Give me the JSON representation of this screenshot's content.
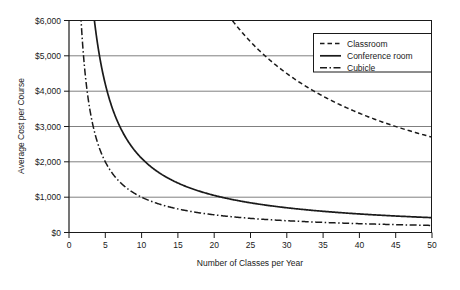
{
  "chart_data": {
    "type": "line",
    "title": "",
    "xlabel": "Number of Classes per Year",
    "ylabel": "Average Cost per Course",
    "xlim": [
      0,
      50
    ],
    "ylim": [
      0,
      6000
    ],
    "xticks": [
      0,
      5,
      10,
      15,
      20,
      25,
      30,
      35,
      40,
      45,
      50
    ],
    "xtick_labels": [
      "0",
      "5",
      "10",
      "15",
      "20",
      "25",
      "30",
      "35",
      "40",
      "45",
      "50"
    ],
    "yticks": [
      0,
      1000,
      2000,
      3000,
      4000,
      5000,
      6000
    ],
    "ytick_labels": [
      "$0",
      "$1,000",
      "$2,000",
      "$3,000",
      "$4,000",
      "$5,000",
      "$6,000"
    ],
    "grid": "horizontal",
    "legend_position": "top-right",
    "series": [
      {
        "name": "Classroom",
        "style": "dashed",
        "color": "#1a1a1a",
        "model": "fixed_cost_over_classes",
        "fixed_cost": 135000,
        "x": [
          22,
          24,
          26,
          28,
          30,
          32,
          34,
          36,
          38,
          40,
          42,
          44,
          46,
          48,
          50
        ],
        "values": [
          6136,
          5625,
          5192,
          4821,
          4500,
          4219,
          3971,
          3750,
          3553,
          3375,
          3214,
          3068,
          2935,
          2813,
          2700
        ]
      },
      {
        "name": "Conference room",
        "style": "solid",
        "color": "#1a1a1a",
        "model": "fixed_cost_over_classes",
        "fixed_cost": 21000,
        "x": [
          3.5,
          4,
          5,
          6,
          8,
          10,
          12,
          15,
          20,
          25,
          30,
          35,
          40,
          45,
          50
        ],
        "values": [
          6000,
          5250,
          4200,
          3500,
          2625,
          2100,
          1750,
          1400,
          1050,
          840,
          700,
          600,
          525,
          467,
          420
        ]
      },
      {
        "name": "Cubicle",
        "style": "dashdot",
        "color": "#1a1a1a",
        "model": "fixed_cost_over_classes",
        "fixed_cost": 10000,
        "x": [
          1.7,
          2,
          2.5,
          3,
          4,
          5,
          6,
          8,
          10,
          15,
          20,
          25,
          30,
          35,
          40,
          45,
          50
        ],
        "values": [
          5882,
          5000,
          4000,
          3333,
          2500,
          2000,
          1667,
          1250,
          1000,
          667,
          500,
          400,
          333,
          286,
          250,
          222,
          200
        ]
      }
    ]
  },
  "legend": {
    "items": [
      {
        "label": "Classroom",
        "style": "dashed"
      },
      {
        "label": "Conference room",
        "style": "solid"
      },
      {
        "label": "Cubicle",
        "style": "dashdot"
      }
    ]
  }
}
